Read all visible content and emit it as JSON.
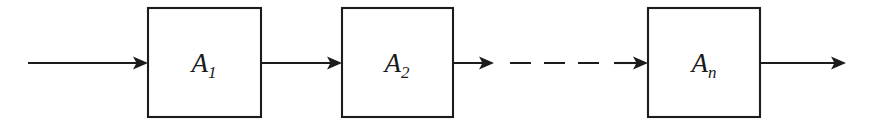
{
  "diagram": {
    "type": "block-diagram",
    "background_color": "#ffffff",
    "line_color": "#1c1c1c",
    "canvas": {
      "width": 881,
      "height": 128
    },
    "signal_axis_y": 63,
    "blocks": [
      {
        "id": "block-a1",
        "label_base": "A",
        "label_subscript": "1",
        "label_text": "A₁",
        "x": 148,
        "y": 8,
        "width": 113,
        "height": 109,
        "label_x": 204,
        "label_y": 72
      },
      {
        "id": "block-a2",
        "label_base": "A",
        "label_subscript": "2",
        "label_text": "A₂",
        "x": 342,
        "y": 8,
        "width": 111,
        "height": 109,
        "label_x": 397,
        "label_y": 72
      },
      {
        "id": "block-an",
        "label_base": "A",
        "label_subscript": "n",
        "label_text": "Aₙ",
        "x": 648,
        "y": 8,
        "width": 112,
        "height": 109,
        "label_x": 704,
        "label_y": 72
      }
    ],
    "connectors": [
      {
        "id": "connector-input",
        "style": "solid",
        "x1": 28,
        "x2": 148,
        "y": 63,
        "arrowhead": "end"
      },
      {
        "id": "connector-a1-to-a2",
        "style": "solid",
        "x1": 261,
        "x2": 342,
        "y": 63,
        "arrowhead": "end"
      },
      {
        "id": "connector-a2-out",
        "style": "solid",
        "x1": 453,
        "x2": 494,
        "y": 63,
        "arrowhead": "end"
      },
      {
        "id": "connector-ellipsis",
        "style": "dashed",
        "x1": 497,
        "x2": 612,
        "y": 63,
        "arrowhead": "none",
        "dash_length": 21,
        "dash_gap": 13,
        "dash_count": 3
      },
      {
        "id": "connector-to-an",
        "style": "solid",
        "x1": 614,
        "x2": 648,
        "y": 63,
        "arrowhead": "end"
      },
      {
        "id": "connector-output",
        "style": "solid",
        "x1": 760,
        "x2": 846,
        "y": 63,
        "arrowhead": "end"
      }
    ],
    "arrowhead_geometry": {
      "length": 15,
      "half_width": 6.5,
      "notch": 3.5
    }
  }
}
